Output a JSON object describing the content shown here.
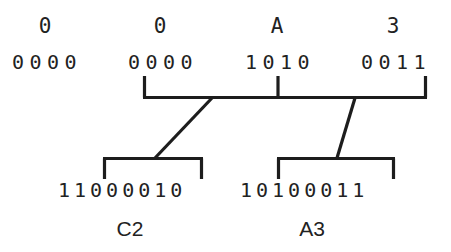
{
  "diagram": {
    "stroke_color": "#1d1d1d",
    "text_color": "#222222",
    "background_color": "#ffffff",
    "hex_row": [
      {
        "label": "0",
        "x": 45
      },
      {
        "label": "0",
        "x": 160
      },
      {
        "label": "A",
        "x": 277
      },
      {
        "label": "3",
        "x": 393
      }
    ],
    "binary_row": [
      {
        "bits": "0000",
        "x": 12
      },
      {
        "bits": "0000",
        "x": 128
      },
      {
        "bits": "1010",
        "x": 245
      },
      {
        "bits": "0011",
        "x": 361
      }
    ],
    "bytes": [
      {
        "name": "C2",
        "bits": "11000010",
        "bits_x": 58,
        "name_x": 100
      },
      {
        "name": "A3",
        "bits": "10100011",
        "bits_x": 240,
        "name_x": 282
      }
    ],
    "top_bracket": {
      "left_x": 143,
      "right_x": 427,
      "mid_x": 278,
      "bar_y": 97,
      "tick_top_y": 76
    },
    "lower_brackets": [
      {
        "left_x": 103,
        "right_x": 203,
        "bar_y": 158,
        "tick_bottom_y": 178
      },
      {
        "left_x": 277,
        "right_x": 395,
        "bar_y": 158,
        "tick_bottom_y": 178
      }
    ],
    "diagonals": [
      {
        "x1": 212,
        "y1": 98,
        "x2": 155,
        "y2": 158
      },
      {
        "x1": 355,
        "y1": 98,
        "x2": 337,
        "y2": 158
      }
    ]
  }
}
